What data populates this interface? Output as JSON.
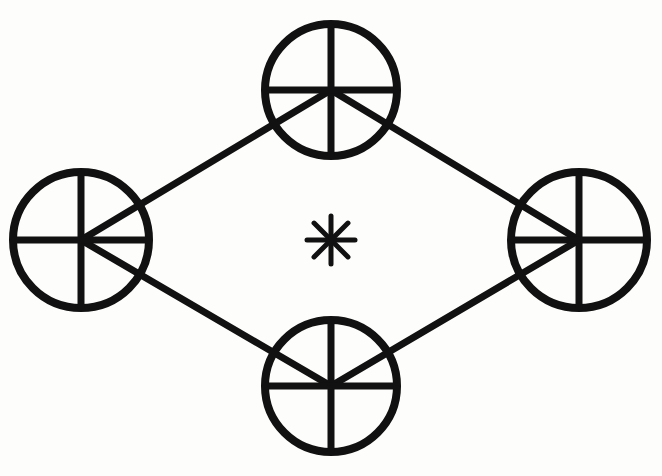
{
  "diagram": {
    "title": "",
    "stroke_color": "#111111",
    "background": "#fdfdfb",
    "nodes": [
      {
        "id": "top",
        "cx": 331,
        "cy": 90,
        "r": 70
      },
      {
        "id": "left",
        "cx": 81,
        "cy": 240,
        "r": 72
      },
      {
        "id": "right",
        "cx": 579,
        "cy": 240,
        "r": 72
      },
      {
        "id": "bottom",
        "cx": 331,
        "cy": 386,
        "r": 70
      }
    ],
    "edges": [
      {
        "from": "top",
        "to": "left"
      },
      {
        "from": "top",
        "to": "right"
      },
      {
        "from": "bottom",
        "to": "left"
      },
      {
        "from": "bottom",
        "to": "right"
      }
    ],
    "center_symbol": {
      "type": "asterisk",
      "cx": 331,
      "cy": 240,
      "size": 24,
      "arms": 8
    }
  }
}
